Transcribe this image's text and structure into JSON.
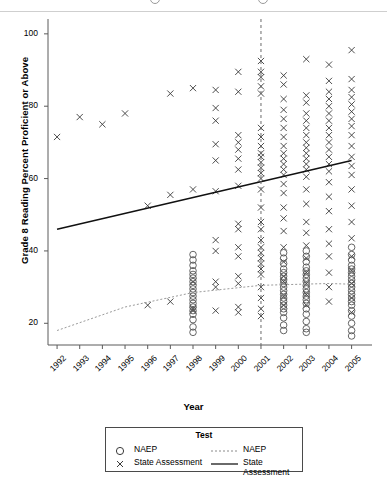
{
  "chart_data": {
    "type": "scatter",
    "title": "",
    "xlabel": "Year",
    "ylabel": "Grade 8 Reading Percent Proficient or Above",
    "xlim": [
      1991.6,
      2005.9
    ],
    "ylim": [
      14,
      103
    ],
    "xticks": [
      "1992",
      "1993",
      "1994",
      "1995",
      "1996",
      "1997",
      "1998",
      "1999",
      "2000",
      "2001",
      "2002",
      "2003",
      "2004",
      "2005"
    ],
    "yticks": [
      "20",
      "40",
      "60",
      "80",
      "100"
    ],
    "grid": false,
    "legend": {
      "position": "below-plot",
      "title": "Test",
      "point_entries": [
        {
          "label": "NAEP",
          "marker": "circle"
        },
        {
          "label": "State Assessment",
          "marker": "cross"
        }
      ],
      "line_entries": [
        {
          "label": "NAEP",
          "style": "dotted"
        },
        {
          "label": "State Assessment",
          "style": "solid"
        }
      ]
    },
    "annotations": [
      {
        "type": "vline",
        "x": 2001,
        "style": "dashed",
        "note": "NCLB reference line at 2001"
      }
    ],
    "series": [
      {
        "name": "State Assessment",
        "marker": "cross",
        "points": [
          [
            1992,
            71.5
          ],
          [
            1993,
            77.0
          ],
          [
            1994,
            75.0
          ],
          [
            1995,
            78.0
          ],
          [
            1996,
            52.5
          ],
          [
            1996,
            25.0
          ],
          [
            1997,
            83.5
          ],
          [
            1997,
            55.5
          ],
          [
            1997,
            26.0
          ],
          [
            1998,
            85.0
          ],
          [
            1998,
            57.0
          ],
          [
            1998,
            31.5
          ],
          [
            1998,
            24.0
          ],
          [
            1998,
            23.5
          ],
          [
            1999,
            84.5
          ],
          [
            1999,
            79.5
          ],
          [
            1999,
            76.0
          ],
          [
            1999,
            69.5
          ],
          [
            1999,
            65.0
          ],
          [
            1999,
            56.5
          ],
          [
            1999,
            43.0
          ],
          [
            1999,
            40.0
          ],
          [
            1999,
            31.5
          ],
          [
            1999,
            30.0
          ],
          [
            1999,
            23.5
          ],
          [
            2000,
            89.5
          ],
          [
            2000,
            84.0
          ],
          [
            2000,
            72.0
          ],
          [
            2000,
            70.0
          ],
          [
            2000,
            68.0
          ],
          [
            2000,
            65.5
          ],
          [
            2000,
            62.5
          ],
          [
            2000,
            58.0
          ],
          [
            2000,
            47.5
          ],
          [
            2000,
            46.0
          ],
          [
            2000,
            41.0
          ],
          [
            2000,
            38.5
          ],
          [
            2000,
            33.0
          ],
          [
            2000,
            31.0
          ],
          [
            2000,
            24.5
          ],
          [
            2000,
            23.0
          ],
          [
            2001,
            92.5
          ],
          [
            2001,
            89.5
          ],
          [
            2001,
            88.0
          ],
          [
            2001,
            85.5
          ],
          [
            2001,
            83.5
          ],
          [
            2001,
            74.0
          ],
          [
            2001,
            71.5
          ],
          [
            2001,
            69.0
          ],
          [
            2001,
            67.0
          ],
          [
            2001,
            66.0
          ],
          [
            2001,
            64.5
          ],
          [
            2001,
            63.0
          ],
          [
            2001,
            61.5
          ],
          [
            2001,
            60.0
          ],
          [
            2001,
            57.0
          ],
          [
            2001,
            52.0
          ],
          [
            2001,
            48.0
          ],
          [
            2001,
            46.0
          ],
          [
            2001,
            43.0
          ],
          [
            2001,
            41.0
          ],
          [
            2001,
            39.5
          ],
          [
            2001,
            38.0
          ],
          [
            2001,
            36.5
          ],
          [
            2001,
            35.0
          ],
          [
            2001,
            33.5
          ],
          [
            2001,
            30.0
          ],
          [
            2001,
            27.0
          ],
          [
            2001,
            24.0
          ],
          [
            2001,
            22.0
          ],
          [
            2002,
            88.5
          ],
          [
            2002,
            86.0
          ],
          [
            2002,
            82.0
          ],
          [
            2002,
            79.0
          ],
          [
            2002,
            76.5
          ],
          [
            2002,
            74.0
          ],
          [
            2002,
            71.5
          ],
          [
            2002,
            69.0
          ],
          [
            2002,
            67.0
          ],
          [
            2002,
            65.5
          ],
          [
            2002,
            64.0
          ],
          [
            2002,
            62.5
          ],
          [
            2002,
            61.0
          ],
          [
            2002,
            58.5
          ],
          [
            2002,
            56.0
          ],
          [
            2002,
            52.0
          ],
          [
            2002,
            49.0
          ],
          [
            2002,
            45.5
          ],
          [
            2002,
            41.0
          ],
          [
            2002,
            37.0
          ],
          [
            2002,
            33.0
          ],
          [
            2002,
            31.5
          ],
          [
            2002,
            27.5
          ],
          [
            2002,
            25.0
          ],
          [
            2003,
            93.0
          ],
          [
            2003,
            83.0
          ],
          [
            2003,
            81.0
          ],
          [
            2003,
            78.0
          ],
          [
            2003,
            76.0
          ],
          [
            2003,
            74.0
          ],
          [
            2003,
            72.0
          ],
          [
            2003,
            70.0
          ],
          [
            2003,
            68.5
          ],
          [
            2003,
            67.0
          ],
          [
            2003,
            65.5
          ],
          [
            2003,
            64.0
          ],
          [
            2003,
            62.5
          ],
          [
            2003,
            60.5
          ],
          [
            2003,
            57.0
          ],
          [
            2003,
            53.0
          ],
          [
            2003,
            48.0
          ],
          [
            2003,
            45.0
          ],
          [
            2003,
            41.5
          ],
          [
            2003,
            38.0
          ],
          [
            2003,
            34.0
          ],
          [
            2003,
            31.0
          ],
          [
            2003,
            28.0
          ],
          [
            2003,
            25.0
          ],
          [
            2004,
            91.5
          ],
          [
            2004,
            87.0
          ],
          [
            2004,
            84.0
          ],
          [
            2004,
            82.0
          ],
          [
            2004,
            80.0
          ],
          [
            2004,
            78.0
          ],
          [
            2004,
            76.0
          ],
          [
            2004,
            74.0
          ],
          [
            2004,
            72.0
          ],
          [
            2004,
            70.0
          ],
          [
            2004,
            68.0
          ],
          [
            2004,
            66.0
          ],
          [
            2004,
            64.0
          ],
          [
            2004,
            62.0
          ],
          [
            2004,
            59.0
          ],
          [
            2004,
            55.0
          ],
          [
            2004,
            51.0
          ],
          [
            2004,
            46.0
          ],
          [
            2004,
            42.0
          ],
          [
            2004,
            38.5
          ],
          [
            2004,
            34.0
          ],
          [
            2004,
            30.0
          ],
          [
            2004,
            26.0
          ],
          [
            2005,
            95.5
          ],
          [
            2005,
            87.5
          ],
          [
            2005,
            84.5
          ],
          [
            2005,
            82.5
          ],
          [
            2005,
            80.5
          ],
          [
            2005,
            78.5
          ],
          [
            2005,
            76.5
          ],
          [
            2005,
            74.5
          ],
          [
            2005,
            72.0
          ],
          [
            2005,
            69.0
          ],
          [
            2005,
            66.0
          ],
          [
            2005,
            63.5
          ],
          [
            2005,
            61.0
          ],
          [
            2005,
            57.0
          ],
          [
            2005,
            52.5
          ],
          [
            2005,
            48.0
          ],
          [
            2005,
            43.5
          ],
          [
            2005,
            38.5
          ],
          [
            2005,
            34.5
          ],
          [
            2005,
            31.0
          ],
          [
            2005,
            27.0
          ],
          [
            2005,
            23.0
          ]
        ]
      },
      {
        "name": "NAEP",
        "marker": "circle",
        "points": [
          [
            1998,
            39.0
          ],
          [
            1998,
            37.5
          ],
          [
            1998,
            36.0
          ],
          [
            1998,
            34.5
          ],
          [
            1998,
            33.5
          ],
          [
            1998,
            32.5
          ],
          [
            1998,
            31.5
          ],
          [
            1998,
            30.5
          ],
          [
            1998,
            29.5
          ],
          [
            1998,
            28.5
          ],
          [
            1998,
            27.5
          ],
          [
            1998,
            26.5
          ],
          [
            1998,
            25.5
          ],
          [
            1998,
            24.5
          ],
          [
            1998,
            23.5
          ],
          [
            1998,
            22.5
          ],
          [
            1998,
            21.0
          ],
          [
            1998,
            19.0
          ],
          [
            1998,
            17.5
          ],
          [
            2002,
            39.5
          ],
          [
            2002,
            38.0
          ],
          [
            2002,
            36.5
          ],
          [
            2002,
            35.0
          ],
          [
            2002,
            34.0
          ],
          [
            2002,
            33.0
          ],
          [
            2002,
            32.0
          ],
          [
            2002,
            31.0
          ],
          [
            2002,
            30.0
          ],
          [
            2002,
            29.0
          ],
          [
            2002,
            28.0
          ],
          [
            2002,
            27.0
          ],
          [
            2002,
            26.0
          ],
          [
            2002,
            25.0
          ],
          [
            2002,
            24.0
          ],
          [
            2002,
            23.0
          ],
          [
            2002,
            21.5
          ],
          [
            2002,
            19.5
          ],
          [
            2002,
            18.0
          ],
          [
            2003,
            40.0
          ],
          [
            2003,
            38.5
          ],
          [
            2003,
            37.0
          ],
          [
            2003,
            35.5
          ],
          [
            2003,
            34.5
          ],
          [
            2003,
            33.5
          ],
          [
            2003,
            32.5
          ],
          [
            2003,
            31.5
          ],
          [
            2003,
            30.5
          ],
          [
            2003,
            29.5
          ],
          [
            2003,
            28.5
          ],
          [
            2003,
            27.5
          ],
          [
            2003,
            26.5
          ],
          [
            2003,
            25.5
          ],
          [
            2003,
            24.0
          ],
          [
            2003,
            22.5
          ],
          [
            2003,
            20.5
          ],
          [
            2003,
            18.5
          ],
          [
            2003,
            17.5
          ],
          [
            2005,
            41.0
          ],
          [
            2005,
            39.0
          ],
          [
            2005,
            37.5
          ],
          [
            2005,
            36.0
          ],
          [
            2005,
            35.0
          ],
          [
            2005,
            34.0
          ],
          [
            2005,
            33.0
          ],
          [
            2005,
            32.0
          ],
          [
            2005,
            31.0
          ],
          [
            2005,
            30.0
          ],
          [
            2005,
            29.0
          ],
          [
            2005,
            28.0
          ],
          [
            2005,
            27.0
          ],
          [
            2005,
            26.0
          ],
          [
            2005,
            25.0
          ],
          [
            2005,
            23.5
          ],
          [
            2005,
            22.0
          ],
          [
            2005,
            20.0
          ],
          [
            2005,
            18.0
          ],
          [
            2005,
            16.5
          ]
        ]
      }
    ],
    "trendlines": [
      {
        "name": "State Assessment",
        "style": "solid",
        "x": [
          1992,
          2005
        ],
        "y": [
          46.0,
          65.0
        ]
      },
      {
        "name": "NAEP",
        "style": "dotted",
        "type": "quadratic",
        "x": [
          1992,
          1995,
          1998,
          2001,
          2004,
          2005
        ],
        "y": [
          18.0,
          24.5,
          28.5,
          30.5,
          31.0,
          30.8
        ]
      }
    ]
  }
}
